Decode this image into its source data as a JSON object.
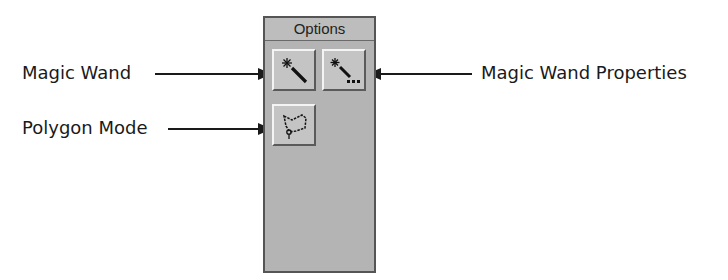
{
  "panel": {
    "title": "Options",
    "buttons": [
      {
        "name": "magic-wand",
        "icon": "magic-wand-icon",
        "tooltip": "Magic Wand"
      },
      {
        "name": "magic-wand-properties",
        "icon": "magic-wand-properties-icon",
        "tooltip": "Magic Wand Properties"
      },
      {
        "name": "polygon-mode",
        "icon": "polygon-lasso-icon",
        "tooltip": "Polygon Mode"
      }
    ]
  },
  "callouts": {
    "magic_wand": "Magic Wand",
    "magic_wand_properties": "Magic Wand Properties",
    "polygon_mode": "Polygon Mode"
  },
  "colors": {
    "panel_bg": "#b4b4b4",
    "panel_border": "#555555",
    "text": "#1a1a1a"
  }
}
